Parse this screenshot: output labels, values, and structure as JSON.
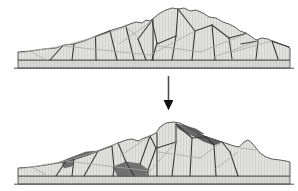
{
  "figure": {
    "title": "Rock slope cross-section: fractured mass before and after deformation",
    "width": 298,
    "height": 191,
    "background_color": "#ffffff",
    "panels": [
      {
        "id": "panel-before",
        "label": "Initial fractured rock slope",
        "position": "top",
        "state": "intact jointed rock mass",
        "void_count": 0
      },
      {
        "id": "panel-after",
        "label": "Deformed rock slope with opened voids",
        "position": "bottom",
        "state": "displaced blocks with dark dilation wedges",
        "void_count": 4
      }
    ],
    "arrow": {
      "name": "transition-arrow",
      "direction": "down",
      "x": 168.5,
      "y_start": 76,
      "y_end": 108,
      "color": "#1a1a1a"
    },
    "colors": {
      "rock_fill": "#dededc",
      "rock_fill_light": "#e6e6e4",
      "base_fill": "#d5d5d3",
      "void_fill": "#6f6f6f",
      "void_fill_dark": "#5d5d5d",
      "outline": "#4a4a4a",
      "joint_major": "#3a3a3a",
      "joint_minor": "#9a9a9a",
      "hatch": "#b9b9b9"
    },
    "geometry": {
      "top_panel": {
        "ground_line_y": 68,
        "base_top_y": 60,
        "crest_y": 8,
        "left_toe_x": 18,
        "right_toe_x": 290
      },
      "bottom_panel": {
        "ground_line_y": 184,
        "base_top_y": 176,
        "crest_y": 122,
        "left_toe_x": 18,
        "right_toe_x": 290
      }
    }
  }
}
